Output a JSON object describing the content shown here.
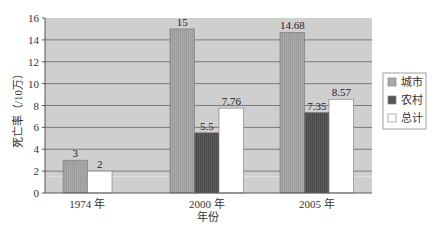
{
  "chart_data": {
    "type": "bar",
    "title": "",
    "xlabel": "年份",
    "ylabel": "死亡率（/10万）",
    "ylim": [
      0,
      16
    ],
    "yticks": [
      0,
      2,
      4,
      6,
      8,
      10,
      12,
      14,
      16
    ],
    "grid": true,
    "legend_position": "right",
    "categories": [
      "1974 年",
      "2000 年",
      "2005 年"
    ],
    "series": [
      {
        "name": "城市",
        "color": "#a9a9a9",
        "values": [
          3,
          15,
          14.68
        ]
      },
      {
        "name": "农村",
        "color": "#555555",
        "values": [
          null,
          5.5,
          7.35
        ]
      },
      {
        "name": "总计",
        "color": "#ffffff",
        "values": [
          2,
          7.76,
          8.57
        ]
      }
    ],
    "value_labels": [
      [
        "3",
        "",
        "2"
      ],
      [
        "15",
        "5.5",
        "7.76"
      ],
      [
        "14.68",
        "7.35",
        "8.57"
      ]
    ]
  },
  "colors": {
    "plot_background": "#cfcfcf",
    "gridline": "#7a7a7a",
    "urban": "#a9a9a9",
    "rural": "#555555",
    "total": "#ffffff"
  }
}
